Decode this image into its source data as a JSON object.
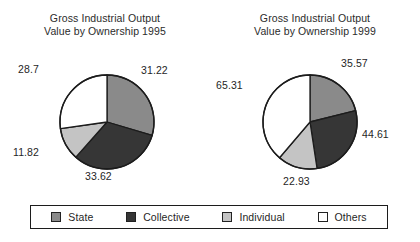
{
  "chart_data": [
    {
      "type": "pie",
      "title": "Gross Industrial Output Value by Ownership 1995",
      "title_lines": [
        "Gross Industrial Output",
        "Value by Ownership 1995"
      ],
      "year": "1995",
      "categories": [
        "State",
        "Collective",
        "Individual",
        "Others"
      ],
      "values": [
        31.22,
        33.62,
        11.82,
        28.7
      ],
      "labels": [
        "31.22",
        "33.62",
        "11.82",
        "28.7"
      ],
      "colors": [
        "#8a8a8a",
        "#363636",
        "#c4c4c4",
        "#ffffff"
      ],
      "start_angle_deg": 0,
      "direction": "clockwise",
      "legend_position": "bottom"
    },
    {
      "type": "pie",
      "title": "Gross Industrial Output Value by Ownership 1999",
      "title_lines": [
        "Gross Industrial Output",
        "Value by Ownership 1999"
      ],
      "year": "1999",
      "categories": [
        "State",
        "Collective",
        "Individual",
        "Others"
      ],
      "values": [
        35.57,
        44.61,
        22.93,
        65.31
      ],
      "labels": [
        "35.57",
        "44.61",
        "22.93",
        "65.31"
      ],
      "colors": [
        "#8a8a8a",
        "#363636",
        "#c4c4c4",
        "#ffffff"
      ],
      "start_angle_deg": 0,
      "direction": "clockwise",
      "legend_position": "bottom"
    }
  ],
  "panels": [
    {
      "title_line1": "Gross Industrial Output",
      "title_line2": "Value by Ownership 1995",
      "labels": {
        "state": "31.22",
        "collective": "33.62",
        "individual": "11.82",
        "others": "28.7"
      }
    },
    {
      "title_line1": "Gross Industrial Output",
      "title_line2": "Value by Ownership 1999",
      "labels": {
        "state": "35.57",
        "collective": "44.61",
        "individual": "22.93",
        "others": "65.31"
      }
    }
  ],
  "legend": {
    "items": [
      {
        "label": "State",
        "color": "#8a8a8a"
      },
      {
        "label": "Collective",
        "color": "#363636"
      },
      {
        "label": "Individual",
        "color": "#c4c4c4"
      },
      {
        "label": "Others",
        "color": "#ffffff"
      }
    ]
  }
}
